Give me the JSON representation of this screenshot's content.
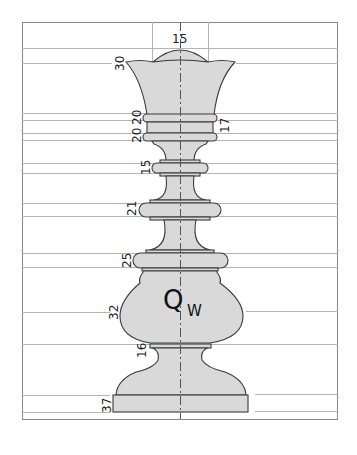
{
  "drawing": {
    "title_label": "Q",
    "title_subscript": "W",
    "colors": {
      "background": "#ffffff",
      "frame": "#8a8a8a",
      "guide_lines": "#b4b4b4",
      "piece_fill": "#d9d9d9",
      "piece_outline": "#3a3a3a",
      "centerline": "#555555",
      "text": "#222222"
    },
    "dimensions": {
      "crown_top": "15",
      "crown": "30",
      "ring_upper": "20",
      "ring_lower": "20",
      "collar": "17",
      "ring_15": "15",
      "ring_21": "21",
      "ring_25": "25",
      "body": "32",
      "neck": "16",
      "base": "37"
    }
  }
}
